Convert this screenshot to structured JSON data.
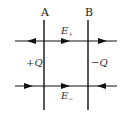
{
  "diagram": {
    "plates": [
      {
        "label": "A",
        "x": 44
      },
      {
        "label": "B",
        "x": 88
      }
    ],
    "charges": {
      "left": "+Q",
      "right": "−Q"
    },
    "fields": {
      "top": {
        "label": "E",
        "subscript": "+"
      },
      "bottom": {
        "label": "E",
        "subscript": "−"
      }
    },
    "colors": {
      "line": "#111111",
      "text": "#333333",
      "background": "#ffffff"
    }
  }
}
